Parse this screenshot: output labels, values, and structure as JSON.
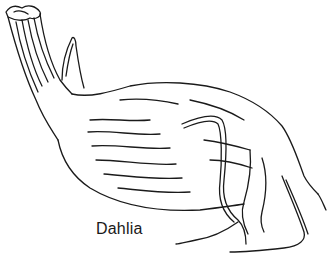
{
  "illustration": {
    "subject": "dahlia tuber line drawing",
    "label": "Dahlia",
    "line_color": "#1a1a1a",
    "background": "#ffffff"
  }
}
